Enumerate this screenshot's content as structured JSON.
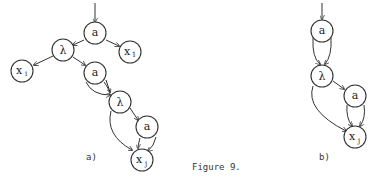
{
  "caption": "Figure 9.",
  "diagram_a": {
    "label": "a)",
    "nodes": [
      {
        "id": "a1",
        "text": "a",
        "sub": ""
      },
      {
        "id": "x1",
        "text": "x",
        "sub": "1"
      },
      {
        "id": "l1",
        "text": "λ",
        "sub": ""
      },
      {
        "id": "xi",
        "text": "x",
        "sub": "i"
      },
      {
        "id": "a2",
        "text": "a",
        "sub": ""
      },
      {
        "id": "l2",
        "text": "λ",
        "sub": ""
      },
      {
        "id": "a3",
        "text": "a",
        "sub": ""
      },
      {
        "id": "xj",
        "text": "x",
        "sub": "j"
      }
    ]
  },
  "diagram_b": {
    "label": "b)",
    "nodes": [
      {
        "id": "a1",
        "text": "a",
        "sub": ""
      },
      {
        "id": "l1",
        "text": "λ",
        "sub": ""
      },
      {
        "id": "a2",
        "text": "a",
        "sub": ""
      },
      {
        "id": "xj",
        "text": "x",
        "sub": "j"
      }
    ]
  }
}
